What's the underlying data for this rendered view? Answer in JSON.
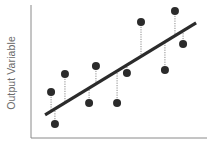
{
  "chart_data": {
    "type": "scatter",
    "title": "",
    "xlabel": "",
    "ylabel": "Output Variable",
    "xlim": [
      0,
      10
    ],
    "ylim": [
      0,
      10
    ],
    "grid": false,
    "legend": null,
    "ticks": false,
    "series": [
      {
        "name": "observations",
        "kind": "scatter",
        "color": "#2b2b2b",
        "x": [
          1.14,
          1.36,
          1.93,
          3.3,
          3.69,
          4.89,
          5.45,
          6.25,
          7.61,
          8.18,
          8.64
        ],
        "y": [
          3.46,
          1.05,
          4.81,
          2.63,
          5.41,
          2.63,
          4.89,
          8.72,
          5.11,
          9.55,
          7.07
        ]
      },
      {
        "name": "regression line",
        "kind": "line",
        "color": "#2b2b2b",
        "x": [
          0.8,
          9.38
        ],
        "y": [
          1.73,
          8.65
        ]
      }
    ],
    "annotations": "Dotted vertical residual lines connect each observation to the regression line"
  },
  "colors": {
    "axis": "#8a8a8a",
    "point": "#2b2b2b",
    "line": "#2b2b2b",
    "residual": "#8a8a8a",
    "label": "#6b6b6b"
  }
}
